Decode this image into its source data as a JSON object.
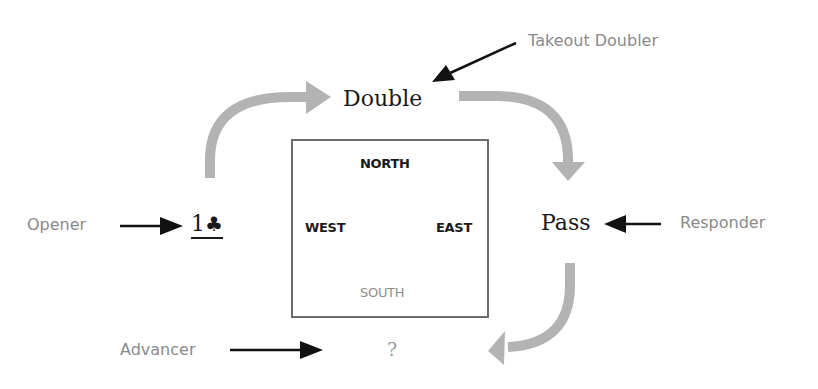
{
  "diagram": {
    "colors": {
      "role_label": "#8a8a8a",
      "bid_text": "#1a1a1a",
      "flow_arrow": "#b3b3b3",
      "pointer_arrow": "#111111",
      "table_border": "#6b6b6b",
      "south_label": "#8c8c8c"
    },
    "table": {
      "north": "NORTH",
      "west": "WEST",
      "east": "EAST",
      "south": "SOUTH"
    },
    "roles": {
      "takeout_doubler": "Takeout Doubler",
      "opener": "Opener",
      "responder": "Responder",
      "advancer": "Advancer"
    },
    "bids": {
      "opener_bid_level": "1",
      "opener_bid_suit": "♣",
      "opener_bid_suit_icon": "club-suit-icon",
      "doubler_bid": "Double",
      "responder_bid": "Pass",
      "advancer_bid": "?"
    },
    "flow": [
      {
        "from": "opener_bid",
        "to": "doubler_bid",
        "icon": "curved-arrow-up-right-icon"
      },
      {
        "from": "doubler_bid",
        "to": "responder_bid",
        "icon": "curved-arrow-right-down-icon"
      },
      {
        "from": "responder_bid",
        "to": "advancer_bid",
        "icon": "curved-arrow-down-left-icon"
      }
    ]
  }
}
